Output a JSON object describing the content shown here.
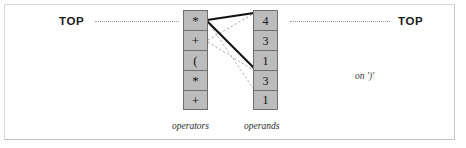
{
  "figure": {
    "title_left": "TOP",
    "title_right": "TOP",
    "annotation": "on ')'"
  },
  "operators": {
    "caption": "operators",
    "cells": [
      {
        "value": "*"
      },
      {
        "value": "+"
      },
      {
        "value": "("
      },
      {
        "value": "*"
      },
      {
        "value": "+"
      }
    ]
  },
  "operands": {
    "caption": "operands",
    "cells": [
      {
        "value": "4"
      },
      {
        "value": "3"
      },
      {
        "value": "1"
      },
      {
        "value": "3"
      },
      {
        "value": "1"
      }
    ]
  },
  "colors": {
    "cell_fill": "#bcbcbc",
    "cell_border": "#6f6f6f",
    "thick_line": "#111111",
    "thin_line": "#9a9a9a",
    "frame": "#d8d8d8",
    "text": "#1a1a1a"
  },
  "connectors": [
    {
      "name": "operators-top-to-operand-4",
      "style": "thick",
      "x1": 208,
      "y1": 20,
      "x2": 253,
      "y2": 13
    },
    {
      "name": "operators-top-to-operand-1",
      "style": "thick",
      "x1": 208,
      "y1": 21,
      "x2": 253,
      "y2": 68
    },
    {
      "name": "operators-top-to-operand-3b",
      "style": "thin",
      "x1": 208,
      "y1": 22,
      "x2": 253,
      "y2": 88
    },
    {
      "name": "operator-plus-to-operand-4",
      "style": "thin",
      "x1": 208,
      "y1": 40,
      "x2": 253,
      "y2": 14
    },
    {
      "name": "operator-plus-to-operand-1",
      "style": "thin",
      "x1": 208,
      "y1": 42,
      "x2": 253,
      "y2": 70
    }
  ]
}
